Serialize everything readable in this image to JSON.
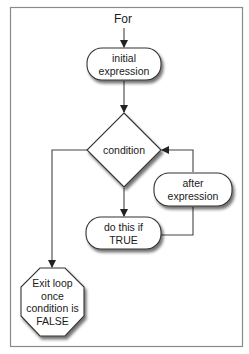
{
  "diagram": {
    "title": "For",
    "type": "flowchart",
    "nodes": {
      "initial": {
        "shape": "rounded-rect",
        "line1": "initial",
        "line2": "expression"
      },
      "condition": {
        "shape": "diamond",
        "label": "condition"
      },
      "body": {
        "shape": "rounded-rect",
        "line1": "do this if",
        "line2": "TRUE"
      },
      "after": {
        "shape": "rounded-rect",
        "line1": "after",
        "line2": "expression"
      },
      "exit": {
        "shape": "octagon",
        "line1": "Exit loop",
        "line2": "once",
        "line3": "condition is",
        "line4": "FALSE"
      }
    },
    "edges": [
      {
        "from": "For",
        "to": "initial"
      },
      {
        "from": "initial",
        "to": "condition"
      },
      {
        "from": "condition",
        "to": "body"
      },
      {
        "from": "body",
        "to": "after"
      },
      {
        "from": "after",
        "to": "condition"
      },
      {
        "from": "condition",
        "to": "exit"
      }
    ],
    "colors": {
      "border": "#8a8a8a",
      "stroke": "#333333",
      "fill": "#ffffff",
      "shadow": "#9a9a9a"
    }
  }
}
